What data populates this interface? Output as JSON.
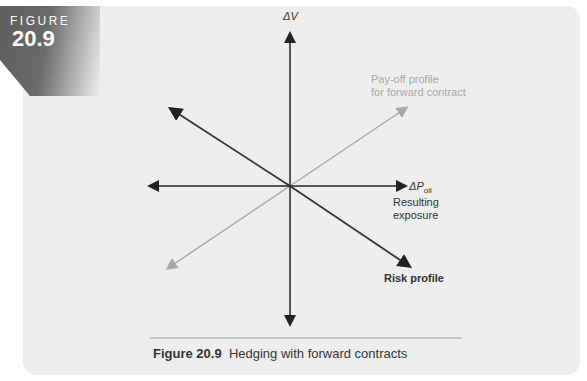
{
  "badge": {
    "label": "FIGURE",
    "number": "20.9"
  },
  "diagram": {
    "y_axis_label": "ΔV",
    "x_axis_label": "ΔP",
    "x_axis_subscript": "oil",
    "forward_label_line1": "Pay-off profile",
    "forward_label_line2": "for forward contract",
    "exposure_label_line1": "Resulting",
    "exposure_label_line2": "exposure",
    "risk_label": "Risk profile",
    "colors": {
      "axis": "#222222",
      "risk": "#333333",
      "forward": "#a8a8a8"
    }
  },
  "caption": {
    "number": "Figure 20.9",
    "text": "Hedging with forward contracts"
  }
}
